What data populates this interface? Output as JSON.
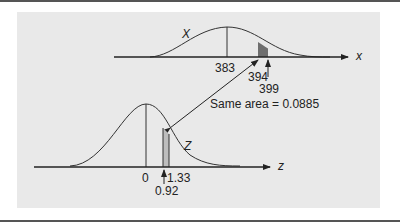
{
  "diagram": {
    "upper": {
      "curve_label": "X",
      "axis_label": "x",
      "ticks": [
        "383",
        "394",
        "399"
      ]
    },
    "lower": {
      "curve_label": "Z",
      "axis_label": "z",
      "ticks": [
        "0",
        "1.33",
        "0.92"
      ]
    },
    "annotation": "Same area  =  0.0885",
    "colors": {
      "background": "#e9e9e9",
      "shade_upper": "#6e6e6e",
      "shade_lower": "#bdbdbd",
      "line": "#222222"
    }
  }
}
